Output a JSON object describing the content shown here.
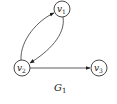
{
  "graph": {
    "title": "G",
    "title_sub": "1",
    "directed": true,
    "nodes": [
      {
        "id": "v1",
        "label": "v",
        "sub": "1",
        "x": 62,
        "y": 9
      },
      {
        "id": "v2",
        "label": "v",
        "sub": "2",
        "x": 22,
        "y": 68
      },
      {
        "id": "v3",
        "label": "v",
        "sub": "3",
        "x": 99,
        "y": 68
      }
    ],
    "edges": [
      {
        "from": "v2",
        "to": "v1",
        "curve": "left"
      },
      {
        "from": "v1",
        "to": "v2",
        "curve": "right"
      },
      {
        "from": "v2",
        "to": "v3",
        "curve": "straight"
      }
    ]
  },
  "colors": {
    "stroke": "#333333",
    "background": "#ffffff"
  }
}
